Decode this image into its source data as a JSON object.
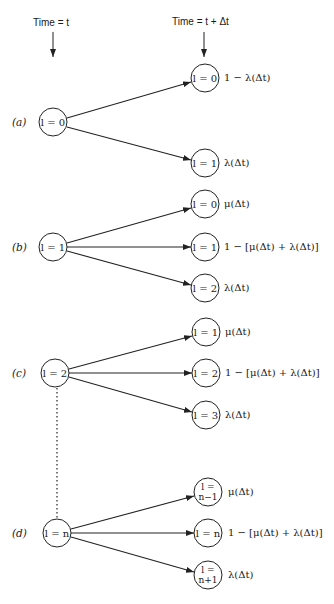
{
  "headers": {
    "time_t": "Time = t",
    "time_t_dt": "Time = t + Δt"
  },
  "cases": [
    {
      "label": "(a)",
      "source": "l = 0",
      "transitions": [
        {
          "target": "l = 0",
          "probability": "1 − λ(Δt)"
        },
        {
          "target": "l = 1",
          "probability": "λ(Δt)"
        }
      ]
    },
    {
      "label": "(b)",
      "source": "l = 1",
      "transitions": [
        {
          "target": "l = 0",
          "probability": "μ(Δt)"
        },
        {
          "target": "l = 1",
          "probability": "1 − [μ(Δt) + λ(Δt)]"
        },
        {
          "target": "l = 2",
          "probability": "λ(Δt)"
        }
      ]
    },
    {
      "label": "(c)",
      "source": "l = 2",
      "transitions": [
        {
          "target": "l = 1",
          "probability": "μ(Δt)"
        },
        {
          "target": "l = 2",
          "probability": "1 − [μ(Δt) + λ(Δt)]"
        },
        {
          "target": "l = 3",
          "probability": "λ(Δt)"
        }
      ]
    },
    {
      "label": "(d)",
      "source": "l = n",
      "transitions": [
        {
          "target": "l = n−1",
          "target_line1": "l =",
          "target_line2": "n−1",
          "probability": "μ(Δt)"
        },
        {
          "target": "l = n",
          "probability": "1 − [μ(Δt) + λ(Δt)]"
        },
        {
          "target": "l = n+1",
          "target_line1": "l =",
          "target_line2": "n+1",
          "probability": "λ(Δt)"
        }
      ]
    }
  ],
  "colors": {
    "stroke": "#222222",
    "background": "#ffffff"
  }
}
